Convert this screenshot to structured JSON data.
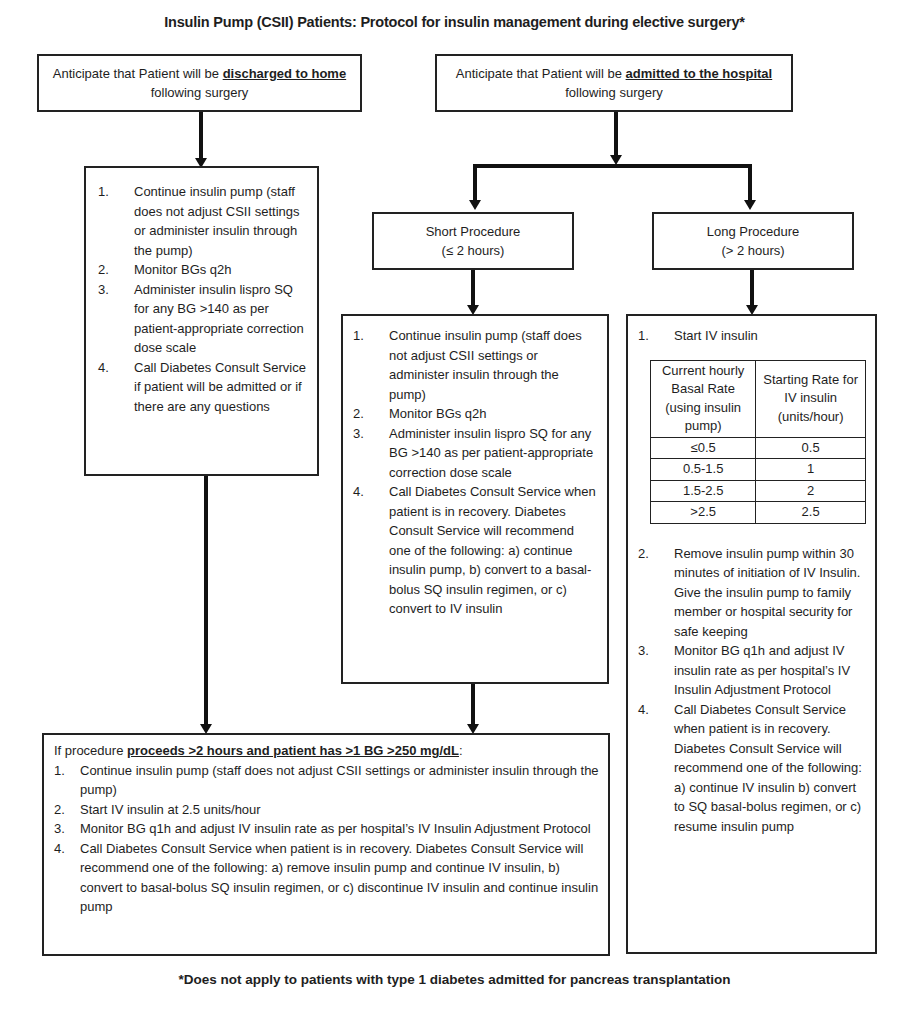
{
  "title": "Insulin Pump (CSII) Patients:  Protocol for insulin management during elective surgery*",
  "discharged_box": {
    "prefix": "Anticipate that Patient will be ",
    "emphasis": "discharged to home",
    "suffix": " following surgery"
  },
  "admitted_box": {
    "prefix": "Anticipate that Patient will be ",
    "emphasis": "admitted to the hospital",
    "suffix": " following surgery"
  },
  "discharged_steps": [
    {
      "num": "1.",
      "text": "Continue insulin pump (staff does not adjust CSII settings or administer insulin through the pump)"
    },
    {
      "num": "2.",
      "text": "Monitor BGs q2h"
    },
    {
      "num": "3.",
      "text": "Administer insulin lispro SQ for any BG >140 as per patient-appropriate correction dose scale"
    },
    {
      "num": "4.",
      "text": "Call Diabetes Consult Service if patient will be admitted or if there are any questions"
    }
  ],
  "short_procedure": {
    "label": "Short Procedure",
    "sublabel": "(≤ 2 hours)",
    "steps": [
      {
        "num": "1.",
        "text": "Continue insulin pump (staff does not adjust CSII settings or administer insulin through the pump)"
      },
      {
        "num": "2.",
        "text": "Monitor BGs q2h"
      },
      {
        "num": "3.",
        "text": "Administer insulin lispro SQ for any BG >140 as per patient-appropriate correction dose scale"
      },
      {
        "num": "4.",
        "text": "Call Diabetes Consult Service when patient is in recovery. Diabetes Consult Service will recommend one of the following: a) continue insulin pump, b) convert to a basal-bolus SQ insulin regimen, or c) convert to IV insulin"
      }
    ]
  },
  "long_procedure": {
    "label": "Long Procedure",
    "sublabel": "(> 2 hours)",
    "step1": {
      "num": "1.",
      "text": "Start IV insulin"
    },
    "table": {
      "headers": [
        "Current hourly Basal Rate (using insulin pump)",
        "Starting Rate for IV insulin (units/hour)"
      ],
      "rows": [
        [
          "≤0.5",
          "0.5"
        ],
        [
          "0.5-1.5",
          "1"
        ],
        [
          "1.5-2.5",
          "2"
        ],
        [
          ">2.5",
          "2.5"
        ]
      ]
    },
    "steps": [
      {
        "num": "2.",
        "text": "Remove insulin pump within 30 minutes of initiation of IV Insulin.  Give the insulin pump to family member or hospital security for safe keeping"
      },
      {
        "num": "3.",
        "text": "Monitor BG q1h and adjust IV insulin rate as per hospital’s IV Insulin Adjustment Protocol"
      },
      {
        "num": "4.",
        "text": "Call Diabetes Consult Service when patient is in recovery. Diabetes Consult Service will recommend one of the following: a) continue IV insulin b) convert to SQ basal-bolus regimen, or c) resume insulin pump"
      }
    ]
  },
  "prolonged_box": {
    "prefix": "If procedure ",
    "emphasis": "proceeds >2 hours and patient has >1 BG >250 mg/dL",
    "suffix": ":",
    "steps": [
      {
        "num": "1.",
        "text": "Continue insulin pump (staff does not adjust CSII settings or administer insulin through the pump)"
      },
      {
        "num": "2.",
        "text": "Start IV insulin at 2.5 units/hour"
      },
      {
        "num": "3.",
        "text": "Monitor BG q1h and adjust IV insulin rate as per hospital’s IV Insulin Adjustment Protocol"
      },
      {
        "num": "4.",
        "text": "Call Diabetes Consult Service when patient is in recovery. Diabetes Consult Service will recommend one of the following: a) remove insulin pump and continue IV insulin, b) convert to basal-bolus SQ insulin regimen, or c) discontinue IV insulin and continue insulin pump"
      }
    ]
  },
  "footnote": "*Does not apply to patients with type 1 diabetes admitted for pancreas transplantation"
}
